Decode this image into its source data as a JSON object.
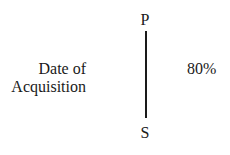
{
  "diagram": {
    "nodes": [
      {
        "id": "P",
        "label": "P"
      },
      {
        "id": "S",
        "label": "S"
      }
    ],
    "edge": {
      "from": "P",
      "to": "S",
      "ownership_label": "80%"
    },
    "annotation": {
      "line1": "Date of",
      "line2": "Acquisition"
    }
  }
}
